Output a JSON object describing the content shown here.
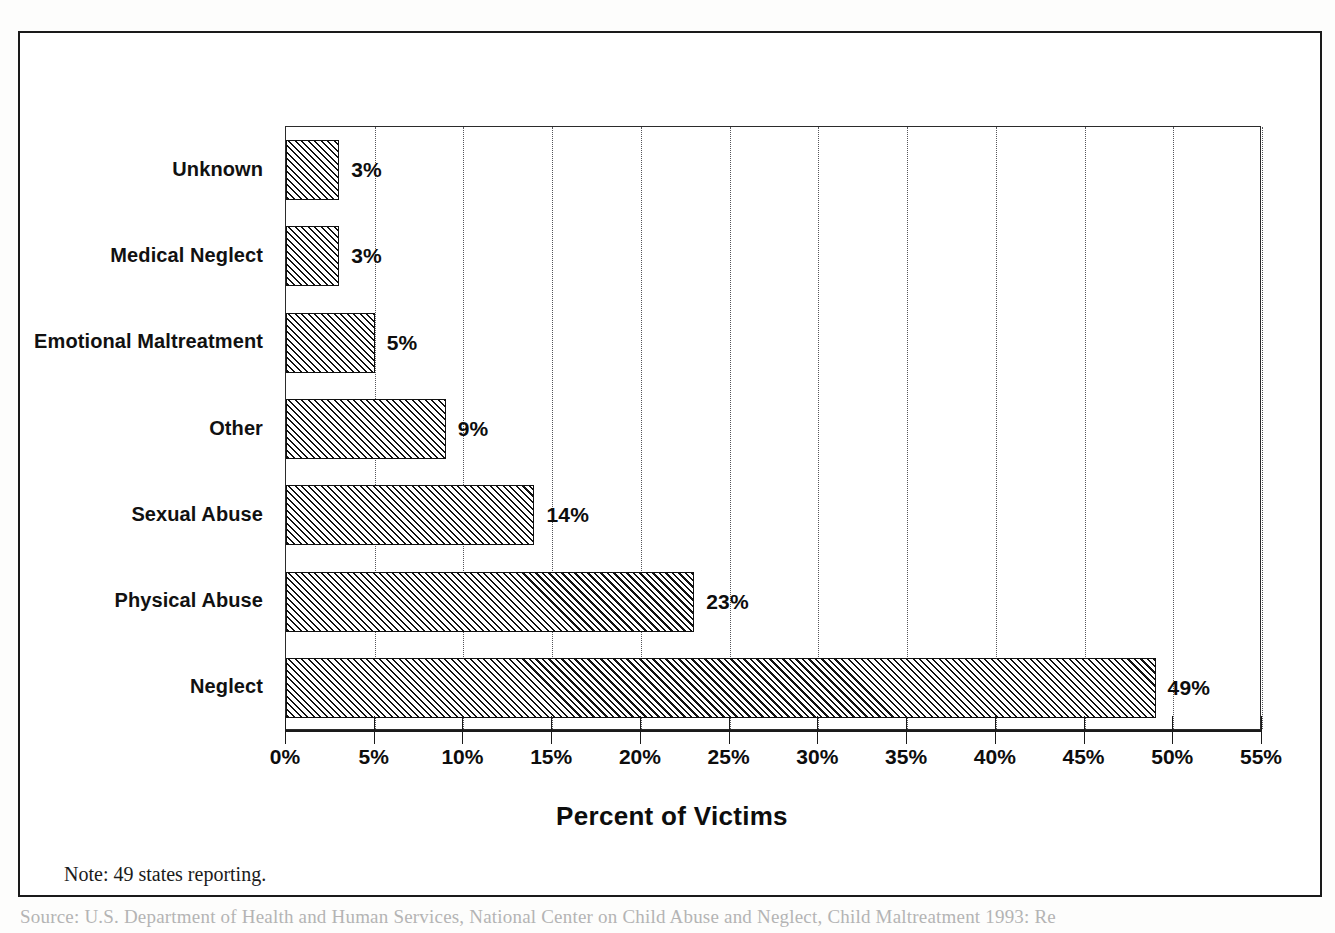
{
  "figure": {
    "note": "Note: 49 states reporting.",
    "source_partial": "Source:  U.S. Department of Health and Human Services, National Center on Child Abuse and Neglect, Child Maltreatment 1993: Re"
  },
  "chart_data": {
    "type": "bar",
    "orientation": "horizontal",
    "title": "",
    "xlabel": "Percent of Victims",
    "ylabel": "",
    "categories": [
      "Neglect",
      "Physical Abuse",
      "Sexual Abuse",
      "Other",
      "Emotional Maltreatment",
      "Medical Neglect",
      "Unknown"
    ],
    "values": [
      49,
      23,
      14,
      9,
      5,
      3,
      3
    ],
    "data_labels": [
      "49%",
      "23%",
      "14%",
      "9%",
      "5%",
      "3%",
      "3%"
    ],
    "xlim": [
      0,
      55
    ],
    "xticks": [
      0,
      5,
      10,
      15,
      20,
      25,
      30,
      35,
      40,
      45,
      50,
      55
    ],
    "xtick_labels": [
      "0%",
      "5%",
      "10%",
      "15%",
      "20%",
      "25%",
      "30%",
      "35%",
      "40%",
      "45%",
      "50%",
      "55%"
    ],
    "grid": "vertical-dotted",
    "legend": "none",
    "bar_fill": "diagonal-hatch",
    "bar_edge_color": "#101010",
    "background_color": "#ffffff"
  }
}
